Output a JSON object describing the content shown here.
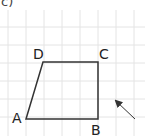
{
  "part_label": "c)",
  "grid": {
    "color": "#e4e4e4",
    "x_lines": [
      8,
      26,
      44,
      62,
      80,
      98,
      116,
      134
    ],
    "y_lines": [
      27,
      45,
      63,
      81,
      99,
      117
    ]
  },
  "shape": {
    "type": "trapezoid",
    "stroke": "#333333",
    "vertices": {
      "A": {
        "label": "A",
        "x": 26,
        "y": 119
      },
      "B": {
        "label": "B",
        "x": 98,
        "y": 119
      },
      "C": {
        "label": "C",
        "x": 98,
        "y": 62
      },
      "D": {
        "label": "D",
        "x": 43,
        "y": 62
      }
    }
  },
  "arrow": {
    "from": {
      "x": 135,
      "y": 119
    },
    "to": {
      "x": 116,
      "y": 101
    },
    "color": "#333333"
  }
}
